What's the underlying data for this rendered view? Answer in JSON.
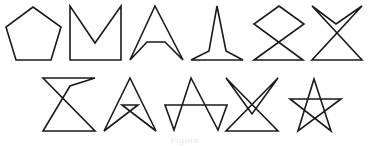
{
  "figure": {
    "stroke_color": "#1a1a1a",
    "background": "#ffffff",
    "rows": [
      {
        "shapes": [
          {
            "name": "pentagon",
            "points": "33,7 61,27 51,60 16,60 6,27"
          },
          {
            "name": "m-notch",
            "points": "70,6 70,60 121,60 121,6 95,43"
          },
          {
            "name": "arrowhead",
            "points": "155,6 183,60 165,42 147,42 130,60"
          },
          {
            "name": "spire",
            "points": "217,6 226,51 243,60 191,60 209,51"
          },
          {
            "name": "diamond-crossed",
            "points": "279,6 304,24 254,60 303,60 254,24"
          },
          {
            "name": "x-chevron",
            "points": "312,6 336,24 362,6 312,60 362,60"
          }
        ]
      },
      {
        "shapes": [
          {
            "name": "hourglass",
            "points": "43,78 95,78 70,86 43,131 95,131"
          },
          {
            "name": "arrow-crossbar",
            "points": "130,78 156,131 122,105 138,105 104,131"
          },
          {
            "name": "zigzag-star",
            "points": "191,78 218,130 227,105 165,105 174,130"
          },
          {
            "name": "crossed-v",
            "points": "226,78 278,131 226,131 278,78 252,114"
          },
          {
            "name": "pentagram",
            "points": "314,79 331,131 290,99 341,99 298,131"
          }
        ]
      }
    ],
    "caption": "Figure"
  }
}
